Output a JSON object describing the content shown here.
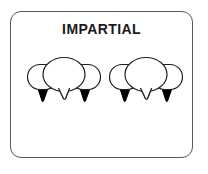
{
  "card": {
    "title": "IMPARTIAL",
    "border_color": "#58595b",
    "background_color": "#ffffff",
    "title_color": "#1a1a1a"
  },
  "illustration": {
    "name": "speech-bubble-groups",
    "group_count": 2,
    "bubbles_per_group": 3,
    "outline_color": "#231f20",
    "fill_color": "#ffffff",
    "tail_fill_color": "#000000",
    "groups": [
      {
        "name": "left-bubble-group",
        "bubbles": [
          {
            "name": "left-side-bubble",
            "tail": "filled-black"
          },
          {
            "name": "right-side-bubble",
            "tail": "filled-black"
          },
          {
            "name": "center-main-bubble",
            "tail": "outlined-white"
          }
        ]
      },
      {
        "name": "right-bubble-group",
        "bubbles": [
          {
            "name": "left-side-bubble",
            "tail": "filled-black"
          },
          {
            "name": "right-side-bubble",
            "tail": "filled-black"
          },
          {
            "name": "center-main-bubble",
            "tail": "outlined-white"
          }
        ]
      }
    ]
  }
}
